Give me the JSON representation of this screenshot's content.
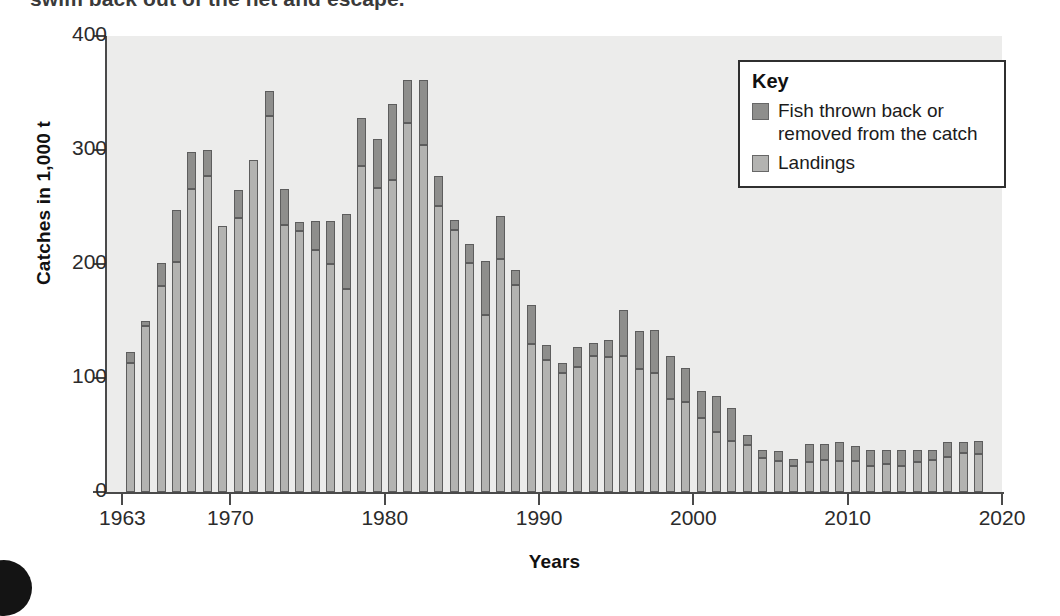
{
  "page": {
    "top_cut_text": "swim back out of the net and escape."
  },
  "legend": {
    "title": "Key",
    "items": [
      {
        "label": "Fish thrown back or removed from the catch",
        "color": "#8e8e8c",
        "key": "thrown"
      },
      {
        "label": "Landings",
        "color": "#b3b3b1",
        "key": "landings"
      }
    ]
  },
  "chart_data": {
    "type": "bar",
    "stacked": true,
    "title": "",
    "xlabel": "Years",
    "ylabel": "Catches in 1,000 t",
    "xlim": [
      1962,
      2020
    ],
    "ylim": [
      0,
      400
    ],
    "ytick_labels": [
      "0",
      "100",
      "200",
      "300",
      "400"
    ],
    "yticks": [
      0,
      100,
      200,
      300,
      400
    ],
    "xtick_labels": [
      "1963",
      "1970",
      "1980",
      "1990",
      "2000",
      "2010",
      "2020"
    ],
    "xticks": [
      1963,
      1970,
      1980,
      1990,
      2000,
      2010,
      2020
    ],
    "grid": false,
    "legend_position": "top-right",
    "plot_background": "#ececeb",
    "categories": [
      1963,
      1964,
      1965,
      1966,
      1967,
      1968,
      1969,
      1970,
      1971,
      1972,
      1973,
      1974,
      1975,
      1976,
      1977,
      1978,
      1979,
      1980,
      1981,
      1982,
      1983,
      1984,
      1985,
      1986,
      1987,
      1988,
      1989,
      1990,
      1991,
      1992,
      1993,
      1994,
      1995,
      1996,
      1997,
      1998,
      1999,
      2000,
      2001,
      2002,
      2003,
      2004,
      2005,
      2006,
      2007,
      2008,
      2009,
      2010,
      2011,
      2012,
      2013,
      2014,
      2015,
      2016,
      2017,
      2018
    ],
    "series": [
      {
        "name": "Landings",
        "color": "#b3b3b1",
        "values": [
          113,
          146,
          181,
          202,
          266,
          277,
          233,
          240,
          291,
          330,
          234,
          229,
          212,
          200,
          178,
          286,
          267,
          274,
          324,
          304,
          251,
          230,
          201,
          155,
          204,
          182,
          130,
          116,
          104,
          110,
          119,
          118,
          119,
          108,
          104,
          82,
          79,
          65,
          53,
          45,
          41,
          30,
          27,
          23,
          26,
          28,
          27,
          27,
          23,
          25,
          23,
          26,
          28,
          31,
          34,
          33
        ]
      },
      {
        "name": "Fish thrown back or removed from the catch",
        "color": "#8e8e8c",
        "values": [
          10,
          4,
          20,
          45,
          32,
          23,
          0,
          25,
          -1,
          22,
          32,
          8,
          26,
          38,
          66,
          42,
          43,
          66,
          37,
          57,
          26,
          9,
          17,
          48,
          38,
          13,
          34,
          13,
          9,
          17,
          12,
          15,
          41,
          33,
          38,
          37,
          30,
          24,
          31,
          29,
          9,
          7,
          9,
          6,
          16,
          14,
          17,
          13,
          14,
          12,
          14,
          11,
          9,
          13,
          10,
          12
        ]
      }
    ],
    "totals": [
      123,
      150,
      201,
      247,
      298,
      300,
      233,
      265,
      290,
      352,
      366,
      237,
      238,
      238,
      244,
      328,
      310,
      340,
      361,
      361,
      277,
      239,
      218,
      203,
      242,
      195,
      164,
      129,
      113,
      127,
      131,
      133,
      160,
      141,
      142,
      119,
      109,
      89,
      84,
      74,
      50,
      37,
      36,
      29,
      42,
      42,
      44,
      40,
      37,
      37,
      37,
      37,
      37,
      44,
      44,
      45
    ]
  }
}
